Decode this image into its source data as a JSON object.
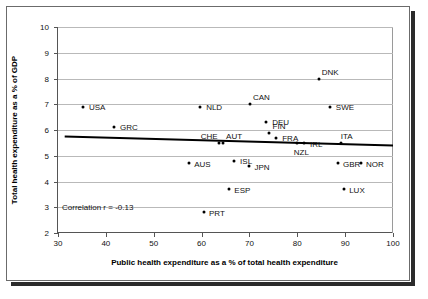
{
  "chart_data": {
    "type": "scatter",
    "title": "",
    "xlabel": "Public health expenditure as a % of total health expenditure",
    "ylabel": "Total health expenditure as a % of GDP",
    "xlim": [
      30,
      100
    ],
    "ylim": [
      2,
      10
    ],
    "xticks": [
      30,
      40,
      50,
      60,
      70,
      80,
      90,
      100
    ],
    "yticks": [
      2,
      3,
      4,
      5,
      6,
      7,
      8,
      9,
      10
    ],
    "grid": true,
    "legend": "none",
    "annotation": "Correlation r = -0.13",
    "correlation": -0.13,
    "points": [
      {
        "label": "USA",
        "x": 35.2,
        "y": 6.9,
        "lx": 6,
        "ly": -4
      },
      {
        "label": "GRC",
        "x": 41.7,
        "y": 6.1,
        "lx": 6,
        "ly": -4
      },
      {
        "label": "NLD",
        "x": 59.7,
        "y": 6.9,
        "lx": 6,
        "ly": -4
      },
      {
        "label": "CAN",
        "x": 70.1,
        "y": 7.0,
        "lx": 3,
        "ly": -11
      },
      {
        "label": "DEU",
        "x": 73.5,
        "y": 6.3,
        "lx": 6,
        "ly": -4
      },
      {
        "label": "SWE",
        "x": 86.8,
        "y": 6.9,
        "lx": 6,
        "ly": -4
      },
      {
        "label": "DNK",
        "x": 84.5,
        "y": 8.0,
        "lx": 3,
        "ly": -11
      },
      {
        "label": "FIN",
        "x": 74.0,
        "y": 5.9,
        "lx": 4,
        "ly": -11
      },
      {
        "label": "FRA",
        "x": 75.6,
        "y": 5.7,
        "lx": 6,
        "ly": -4
      },
      {
        "label": "CHE",
        "x": 63.6,
        "y": 5.5,
        "lx": -18,
        "ly": -11
      },
      {
        "label": "AUT",
        "x": 64.5,
        "y": 5.5,
        "lx": 3,
        "ly": -11
      },
      {
        "label": "NZL",
        "x": 79.9,
        "y": 5.5,
        "lx": -3,
        "ly": 5
      },
      {
        "label": "IRL",
        "x": 81.4,
        "y": 5.5,
        "lx": 6,
        "ly": -3
      },
      {
        "label": "ITA",
        "x": 89.1,
        "y": 5.5,
        "lx": 0,
        "ly": -11
      },
      {
        "label": "AUS",
        "x": 57.4,
        "y": 4.7,
        "lx": 5,
        "ly": -3
      },
      {
        "label": "ISL",
        "x": 66.8,
        "y": 4.8,
        "lx": 6,
        "ly": -4
      },
      {
        "label": "JPN",
        "x": 70.0,
        "y": 4.6,
        "lx": 5,
        "ly": -3
      },
      {
        "label": "GBR",
        "x": 88.5,
        "y": 4.7,
        "lx": 5,
        "ly": -3
      },
      {
        "label": "NOR",
        "x": 93.3,
        "y": 4.7,
        "lx": 5,
        "ly": -3
      },
      {
        "label": "ESP",
        "x": 65.8,
        "y": 3.7,
        "lx": 5,
        "ly": -3
      },
      {
        "label": "LUX",
        "x": 89.8,
        "y": 3.7,
        "lx": 5,
        "ly": -3
      },
      {
        "label": "PRT",
        "x": 60.5,
        "y": 2.8,
        "lx": 5,
        "ly": -3
      }
    ],
    "trendline": {
      "x0": 31.4,
      "y0": 5.75,
      "x1": 100.0,
      "y1": 5.4
    }
  }
}
